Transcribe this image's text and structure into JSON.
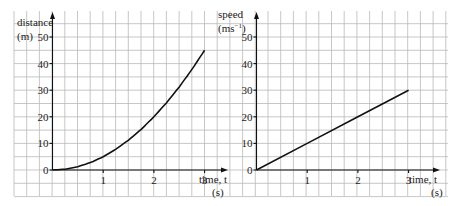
{
  "chart_data": [
    {
      "type": "line",
      "title": "",
      "xlabel": "time, t",
      "xunit": "(s)",
      "ylabel": "distance",
      "yunit": "(m)",
      "xlim": [
        0,
        3
      ],
      "ylim": [
        0,
        50
      ],
      "xticks": [
        1,
        2,
        3
      ],
      "yticks": [
        0,
        10,
        20,
        30,
        40,
        50
      ],
      "grid": true,
      "series": [
        {
          "name": "distance",
          "formula": "s = 5t^2",
          "x": [
            0,
            0.25,
            0.5,
            0.75,
            1,
            1.25,
            1.5,
            1.75,
            2,
            2.25,
            2.5,
            2.75,
            3
          ],
          "y": [
            0,
            0.3125,
            1.25,
            2.8125,
            5,
            7.8125,
            11.25,
            15.3125,
            20,
            25.3125,
            31.25,
            37.8125,
            45
          ]
        }
      ]
    },
    {
      "type": "line",
      "title": "",
      "xlabel": "time, t",
      "xunit": "(s)",
      "ylabel": "speed",
      "yunit": "(ms⁻¹)",
      "xlim": [
        0,
        3
      ],
      "ylim": [
        0,
        50
      ],
      "xticks": [
        1,
        2,
        3
      ],
      "yticks": [
        0,
        10,
        20,
        30,
        40,
        50
      ],
      "grid": true,
      "series": [
        {
          "name": "speed",
          "formula": "v = 10t",
          "x": [
            0,
            1,
            2,
            3
          ],
          "y": [
            0,
            10,
            20,
            30
          ]
        }
      ]
    }
  ],
  "panels": [
    {
      "ylabel": "distance",
      "yunit": "(m)",
      "xlabel": "time, t",
      "xunit": "(s)"
    },
    {
      "ylabel": "speed",
      "yunit": "(ms⁻¹)",
      "xlabel": "time, t",
      "xunit": "(s)"
    }
  ],
  "colors": {
    "grid": "#b9b9b9",
    "axis": "#111111",
    "curve": "#111111",
    "background": "#ffffff"
  }
}
